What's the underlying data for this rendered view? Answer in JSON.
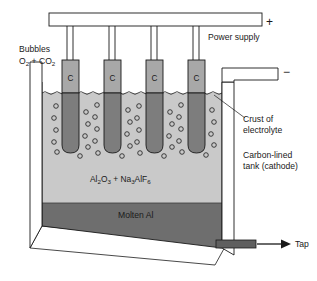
{
  "diagram": {
    "labels": {
      "power_supply": "Power supply",
      "plus_terminal": "+",
      "minus_terminal": "−",
      "bubbles": "Bubbles",
      "bubbles_gases_main": "O",
      "bubbles_gases_sub1": "2",
      "bubbles_gases_plus": " + CO",
      "bubbles_gases_sub2": "2",
      "crust_line1": "Crust of",
      "crust_line2": "electrolyte",
      "tank_line1": "Carbon-lined",
      "tank_line2": "tank (cathode)",
      "molten_al": "Molten Al",
      "tap": "Tap"
    },
    "electrolyte_formula": {
      "part1": "Al",
      "sub1": "2",
      "part2": "O",
      "sub2": "3",
      "part3": " + Na",
      "sub3": "3",
      "part4": "AlF",
      "sub4": "6"
    },
    "anodes": [
      {
        "letter": "C"
      },
      {
        "letter": "C"
      },
      {
        "letter": "C"
      },
      {
        "letter": "C"
      }
    ],
    "colors": {
      "outline": "#1a1a1a",
      "background": "#ffffff",
      "electrolyte": "#c9c9c9",
      "molten_aluminium": "#6e6e6e",
      "anode_above": "#a8a8a8",
      "anode_below": "#7d7d7d",
      "busbar_fill": "#ffffff",
      "text": "#1a1a1a"
    }
  }
}
